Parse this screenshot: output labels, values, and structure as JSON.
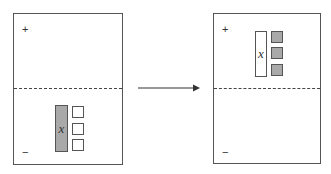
{
  "diagram": {
    "colors": {
      "negative_fill": "#a9a9a9",
      "positive_fill": "#ffffff",
      "stroke": "#555555"
    },
    "panels": [
      {
        "id": "before",
        "plus_label": "+",
        "minus_label": "−",
        "x_tile": {
          "label": "x",
          "region": "negative",
          "fill": "#a9a9a9"
        },
        "unit_tiles": {
          "count": 3,
          "region": "negative",
          "fill": "#ffffff"
        }
      },
      {
        "id": "after",
        "plus_label": "+",
        "minus_label": "−",
        "x_tile": {
          "label": "x",
          "region": "positive",
          "fill": "#ffffff"
        },
        "unit_tiles": {
          "count": 3,
          "region": "positive",
          "fill": "#a9a9a9"
        }
      }
    ],
    "arrow": {
      "direction": "right"
    }
  }
}
